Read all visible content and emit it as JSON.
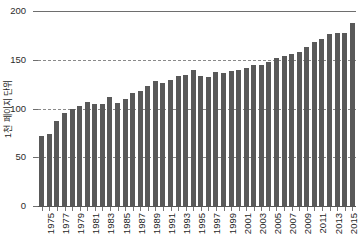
{
  "chart_data": {
    "type": "bar",
    "title": "",
    "subtitle": "",
    "xlabel": "",
    "ylabel": "1천 페이지 단위",
    "ylim": [
      0,
      200
    ],
    "yticks": [
      0,
      50,
      100,
      150,
      200
    ],
    "ytick_labels": [
      "0",
      "50",
      "100",
      "150",
      "200"
    ],
    "grid": true,
    "grid_axis": "y",
    "legend": false,
    "legend_position": "none",
    "bar_color": "#595959",
    "background_color": "#ffffff",
    "gridline_color": "#6e6e6e",
    "axis_text_color": "#1f1f1f",
    "xtick_label_rotation": -90,
    "xtick_label_interval": 2,
    "categories": [
      "1975",
      "1976",
      "1977",
      "1978",
      "1979",
      "1980",
      "1981",
      "1982",
      "1983",
      "1984",
      "1985",
      "1986",
      "1987",
      "1988",
      "1989",
      "1990",
      "1991",
      "1992",
      "1993",
      "1994",
      "1995",
      "1996",
      "1997",
      "1998",
      "1999",
      "2000",
      "2001",
      "2002",
      "2003",
      "2004",
      "2005",
      "2006",
      "2007",
      "2008",
      "2009",
      "2010",
      "2011",
      "2012",
      "2013",
      "2014",
      "2015",
      "2016"
    ],
    "xtick_labels_shown": [
      "1975",
      "1977",
      "1979",
      "1981",
      "1983",
      "1985",
      "1987",
      "1989",
      "1991",
      "1993",
      "1995",
      "1997",
      "1999",
      "2001",
      "2003",
      "2005",
      "2007",
      "2009",
      "2011",
      "2013",
      "2015"
    ],
    "values": [
      72,
      74,
      87,
      95,
      100,
      103,
      107,
      105,
      105,
      112,
      106,
      110,
      116,
      118,
      123,
      128,
      126,
      129,
      133,
      134,
      140,
      133,
      132,
      137,
      136,
      138,
      140,
      142,
      145,
      145,
      148,
      152,
      154,
      156,
      158,
      163,
      168,
      171,
      176,
      177,
      177,
      180
    ],
    "last_value": 188,
    "series": [
      {
        "name": "",
        "values": [
          72,
          74,
          87,
          95,
          100,
          103,
          107,
          105,
          105,
          112,
          106,
          110,
          116,
          118,
          123,
          128,
          126,
          129,
          133,
          134,
          140,
          133,
          132,
          137,
          136,
          138,
          140,
          142,
          145,
          145,
          148,
          152,
          154,
          156,
          158,
          163,
          168,
          171,
          176,
          177,
          177,
          188
        ]
      }
    ]
  }
}
